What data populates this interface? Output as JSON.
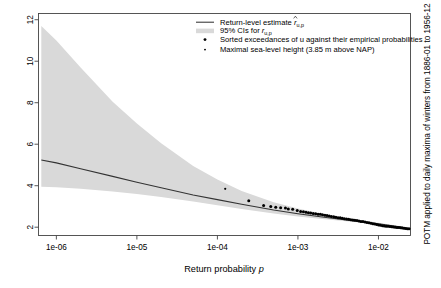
{
  "chart_data": {
    "type": "line",
    "title": "",
    "xlabel": "Return probability p",
    "ylabel": "",
    "right_label": "POTM applied to daily maxima of winters from 1886-01 to 1956-12",
    "x_scale": "log",
    "y_scale": "linear",
    "xlim": [
      6e-07,
      0.025
    ],
    "ylim": [
      1.6,
      12.3
    ],
    "xticks": [
      "1e-06",
      "1e-05",
      "1e-04",
      "1e-03",
      "1e-02"
    ],
    "xtick_values": [
      1e-06,
      1e-05,
      0.0001,
      0.001,
      0.01
    ],
    "yticks": [
      "12",
      "10",
      "8",
      "6",
      "4",
      "2"
    ],
    "ytick_values": [
      12,
      10,
      8,
      6,
      4,
      2
    ],
    "grid": false,
    "legend_position": "top-center",
    "legend": [
      {
        "key": "return-level-line",
        "label_prefix": "Return-level estimate",
        "symbol": "line",
        "math": "r",
        "hat": true,
        "subscript": "u,p",
        "color": "#333333"
      },
      {
        "key": "ci-band",
        "label_prefix": "95% CIs for",
        "symbol": "band",
        "math": "r",
        "hat": false,
        "subscript": "u,p",
        "color": "#d9d9d9"
      },
      {
        "key": "exceedances-points",
        "label_prefix": "Sorted exceedances of u against their empirical probabilities",
        "symbol": "point-large",
        "color": "#000000"
      },
      {
        "key": "max-point",
        "label_prefix": "Maximal sea-level height (3.85 m above NAP)",
        "symbol": "point-small",
        "color": "#000000"
      }
    ],
    "series": [
      {
        "name": "Return-level estimate r_{u,p}",
        "type": "line",
        "color": "#333333",
        "x": [
          6.5e-07,
          1e-06,
          2e-06,
          5e-06,
          1e-05,
          2e-05,
          5e-05,
          0.0001,
          0.0002,
          0.0005,
          0.001,
          0.002,
          0.005,
          0.01,
          0.02,
          0.024
        ],
        "y": [
          5.24,
          5.1,
          4.82,
          4.45,
          4.17,
          3.9,
          3.55,
          3.33,
          3.11,
          2.83,
          2.65,
          2.49,
          2.3,
          2.17,
          2.0,
          1.92
        ]
      },
      {
        "name": "95% CI upper",
        "type": "band-upper",
        "color": "#d9d9d9",
        "x": [
          6.5e-07,
          1e-06,
          2e-06,
          5e-06,
          1e-05,
          2e-05,
          5e-05,
          0.0001,
          0.0002,
          0.0005,
          0.001,
          0.002,
          0.005,
          0.01,
          0.02,
          0.024
        ],
        "y": [
          11.7,
          11.0,
          9.7,
          8.05,
          7.0,
          6.05,
          4.95,
          4.3,
          3.75,
          3.2,
          2.9,
          2.65,
          2.38,
          2.22,
          2.03,
          1.95
        ]
      },
      {
        "name": "95% CI lower",
        "type": "band-lower",
        "color": "#d9d9d9",
        "x": [
          6.5e-07,
          1e-06,
          2e-06,
          5e-06,
          1e-05,
          2e-05,
          5e-05,
          0.0001,
          0.0002,
          0.0005,
          0.001,
          0.002,
          0.005,
          0.01,
          0.02,
          0.024
        ],
        "y": [
          3.95,
          3.92,
          3.85,
          3.72,
          3.6,
          3.46,
          3.24,
          3.06,
          2.88,
          2.66,
          2.52,
          2.4,
          2.25,
          2.14,
          1.99,
          1.91
        ]
      },
      {
        "name": "Sorted exceedances of u",
        "type": "scatter",
        "color": "#000000",
        "points": [
          [
            0.000245,
            3.27
          ],
          [
            0.000375,
            3.04
          ],
          [
            0.00046,
            3.0
          ],
          [
            0.00053,
            2.96
          ],
          [
            0.00061,
            2.94
          ],
          [
            0.0007,
            2.92
          ],
          [
            0.00076,
            2.88
          ],
          [
            0.00086,
            2.87
          ],
          [
            0.00098,
            2.8
          ],
          [
            0.00108,
            2.76
          ],
          [
            0.00117,
            2.74
          ],
          [
            0.00126,
            2.72
          ],
          [
            0.00135,
            2.7
          ],
          [
            0.00144,
            2.68
          ],
          [
            0.00155,
            2.66
          ],
          [
            0.00166,
            2.65
          ],
          [
            0.00178,
            2.63
          ],
          [
            0.0019,
            2.62
          ],
          [
            0.00202,
            2.6
          ],
          [
            0.00216,
            2.58
          ],
          [
            0.0023,
            2.56
          ],
          [
            0.00245,
            2.54
          ],
          [
            0.0026,
            2.52
          ],
          [
            0.00278,
            2.5
          ],
          [
            0.00296,
            2.48
          ],
          [
            0.00315,
            2.46
          ],
          [
            0.00335,
            2.45
          ],
          [
            0.00356,
            2.43
          ],
          [
            0.00378,
            2.41
          ],
          [
            0.00402,
            2.4
          ],
          [
            0.00427,
            2.38
          ],
          [
            0.00453,
            2.36
          ],
          [
            0.0048,
            2.35
          ],
          [
            0.00509,
            2.33
          ],
          [
            0.0054,
            2.32
          ],
          [
            0.00572,
            2.3
          ],
          [
            0.00606,
            2.28
          ],
          [
            0.00642,
            2.27
          ],
          [
            0.0068,
            2.25
          ],
          [
            0.0072,
            2.23
          ],
          [
            0.00762,
            2.21
          ],
          [
            0.00806,
            2.19
          ],
          [
            0.00852,
            2.17
          ],
          [
            0.00901,
            2.15
          ],
          [
            0.00952,
            2.13
          ],
          [
            0.01006,
            2.11
          ],
          [
            0.01063,
            2.09
          ],
          [
            0.01122,
            2.07
          ],
          [
            0.01184,
            2.06
          ],
          [
            0.01249,
            2.05
          ],
          [
            0.01317,
            2.04
          ],
          [
            0.01388,
            2.03
          ],
          [
            0.01462,
            2.02
          ],
          [
            0.0154,
            2.01
          ],
          [
            0.01621,
            2.0
          ],
          [
            0.01706,
            1.99
          ],
          [
            0.01794,
            1.98
          ],
          [
            0.01886,
            1.97
          ],
          [
            0.01982,
            1.96
          ],
          [
            0.02082,
            1.95
          ],
          [
            0.02186,
            1.94
          ],
          [
            0.02294,
            1.93
          ],
          [
            0.024,
            1.92
          ]
        ]
      },
      {
        "name": "Maximal sea-level height",
        "type": "scatter-single",
        "color": "#000000",
        "points": [
          [
            0.000125,
            3.85
          ]
        ]
      }
    ]
  }
}
